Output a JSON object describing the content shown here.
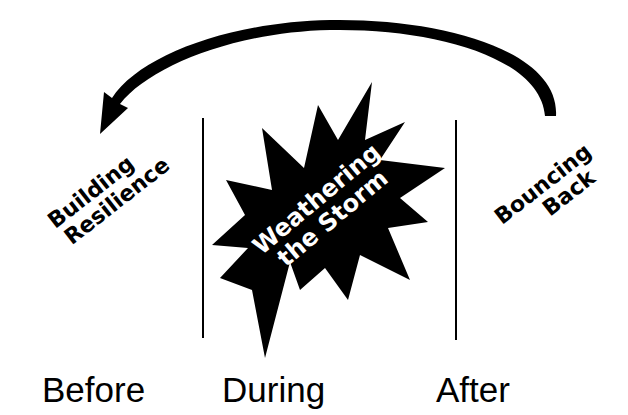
{
  "diagram": {
    "phases": [
      {
        "id": "before",
        "label": "Before",
        "stage_lines": [
          "Building",
          "Resilience"
        ]
      },
      {
        "id": "during",
        "label": "During",
        "stage_lines": [
          "Weathering",
          "the Storm"
        ]
      },
      {
        "id": "after",
        "label": "After",
        "stage_lines": [
          "Bouncing",
          "Back"
        ]
      }
    ],
    "cycle_arrow": {
      "from": "after",
      "to": "before",
      "direction": "counter-clockwise over top"
    },
    "colors": {
      "ink": "#000000",
      "background": "#ffffff",
      "storm_text": "#ffffff"
    }
  }
}
